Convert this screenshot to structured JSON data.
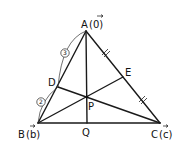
{
  "diagram": {
    "type": "triangle-vector-geometry",
    "points": {
      "A": {
        "label": "A",
        "vector": "(0⃗)",
        "x": 86,
        "y": 31
      },
      "B": {
        "label": "B",
        "vector": "(b⃗)",
        "x": 38,
        "y": 123
      },
      "C": {
        "label": "C",
        "vector": "(c⃗)",
        "x": 160,
        "y": 123
      },
      "D": {
        "label": "D",
        "x": 58,
        "y": 87
      },
      "E": {
        "label": "E",
        "x": 123,
        "y": 77
      },
      "P": {
        "label": "P",
        "x": 87,
        "y": 97
      },
      "Q": {
        "label": "Q",
        "x": 87,
        "y": 123
      }
    },
    "labels": {
      "A": "A",
      "A_vec": "(0)",
      "B": "B",
      "B_vec": "(b)",
      "C": "C",
      "C_vec": "(c)",
      "D": "D",
      "E": "E",
      "P": "P",
      "Q": "Q"
    },
    "ratios": {
      "AD": "3",
      "DB": "2"
    },
    "segments": [
      "AB",
      "BC",
      "CA",
      "AQ",
      "BE",
      "CD"
    ],
    "equal_marks": [
      "AE",
      "EC"
    ]
  }
}
